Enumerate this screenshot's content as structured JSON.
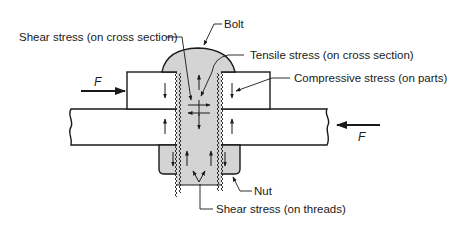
{
  "diagram": {
    "labels": {
      "bolt": "Bolt",
      "shear_cross": "Shear stress (on cross section)",
      "tensile_cross": "Tensile stress (on cross section)",
      "compressive_parts": "Compressive stress (on parts)",
      "nut": "Nut",
      "shear_threads": "Shear stress (on threads)"
    },
    "forces": {
      "left": "F",
      "right": "F"
    },
    "colors": {
      "line": "#1a1a1a",
      "bolt_fill": "#d4d4d4",
      "plate_fill": "#ffffff",
      "background": "#ffffff"
    }
  }
}
